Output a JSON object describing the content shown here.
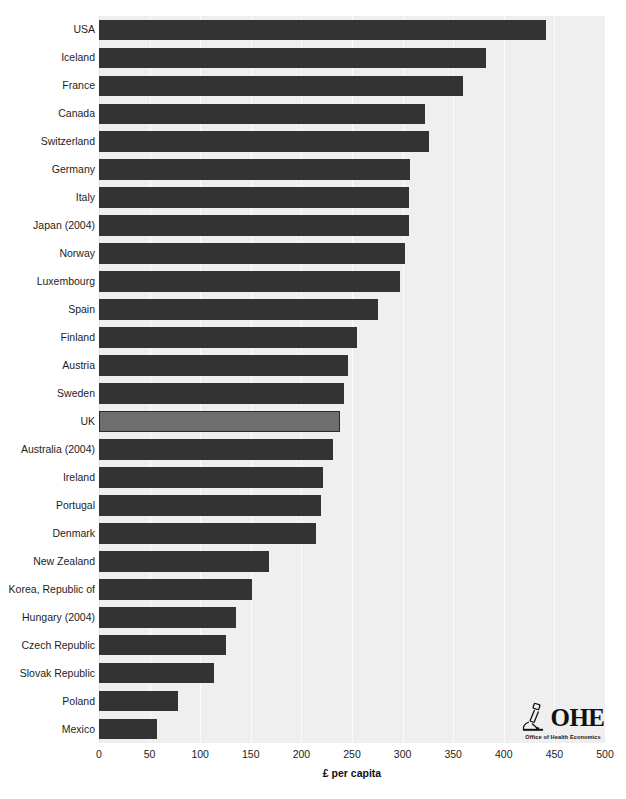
{
  "chart_data": {
    "type": "bar",
    "orientation": "horizontal",
    "title": "",
    "xlabel": "£ per capita",
    "ylabel": "",
    "xlim": [
      0,
      500
    ],
    "xticks": [
      0,
      50,
      100,
      150,
      200,
      250,
      300,
      350,
      400,
      450,
      500
    ],
    "xtick_labels": [
      "0",
      "50",
      "100",
      "150",
      "200",
      "250",
      "300",
      "350",
      "400",
      "450",
      "500"
    ],
    "grid": true,
    "legend": false,
    "categories": [
      "USA",
      "Iceland",
      "France",
      "Canada",
      "Switzerland",
      "Germany",
      "Italy",
      "Japan (2004)",
      "Norway",
      "Luxembourg",
      "Spain",
      "Finland",
      "Austria",
      "Sweden",
      "UK",
      "Australia (2004)",
      "Ireland",
      "Portugal",
      "Denmark",
      "New Zealand",
      "Korea, Republic of",
      "Hungary (2004)",
      "Czech Republic",
      "Slovak Republic",
      "Poland",
      "Mexico"
    ],
    "values": [
      442,
      382,
      360,
      322,
      326,
      307,
      306,
      306,
      302,
      297,
      276,
      255,
      246,
      242,
      238,
      231,
      221,
      219,
      214,
      168,
      151,
      135,
      125,
      114,
      78,
      57
    ],
    "highlight_category": "UK",
    "highlight_index": 14
  },
  "colors": {
    "bar": "#333333",
    "bar_highlight": "#6e6e6e",
    "bar_highlight_border": "#2a2a2a",
    "plot_background": "#efefef",
    "gridline": "#fbfbfb",
    "page_background": "#ffffff",
    "text": "#1d1d1d"
  },
  "logo": {
    "mark_name": "microscope-icon",
    "wordmark": "OHE",
    "subtitle": "Office of Health Economics"
  }
}
